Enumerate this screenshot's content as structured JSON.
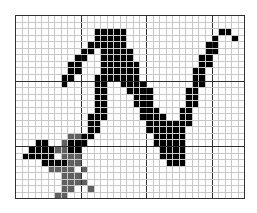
{
  "editor": {
    "type": "pixel-grid",
    "cols": 35,
    "rows": 28,
    "cell_px": 6.55,
    "major_every": 10,
    "colors": {
      "background": "#ffffff",
      "minor_grid": "#c8c8c8",
      "major_grid": "#303030",
      "ink": "#000000",
      "gray": "#606060"
    },
    "black_cells": [
      [
        12,
        3
      ],
      [
        13,
        2
      ],
      [
        14,
        2
      ],
      [
        15,
        2
      ],
      [
        16,
        2
      ],
      [
        12,
        2
      ],
      [
        11,
        4
      ],
      [
        12,
        4
      ],
      [
        10,
        5
      ],
      [
        11,
        5
      ],
      [
        9,
        6
      ],
      [
        10,
        6
      ],
      [
        8,
        7
      ],
      [
        9,
        7
      ],
      [
        8,
        8
      ],
      [
        9,
        8
      ],
      [
        7,
        9
      ],
      [
        8,
        9
      ],
      [
        7,
        10
      ],
      [
        13,
        3
      ],
      [
        14,
        3
      ],
      [
        15,
        3
      ],
      [
        16,
        3
      ],
      [
        13,
        4
      ],
      [
        14,
        4
      ],
      [
        15,
        4
      ],
      [
        16,
        4
      ],
      [
        13,
        5
      ],
      [
        14,
        5
      ],
      [
        15,
        5
      ],
      [
        16,
        5
      ],
      [
        17,
        5
      ],
      [
        13,
        6
      ],
      [
        14,
        6
      ],
      [
        15,
        6
      ],
      [
        16,
        6
      ],
      [
        17,
        6
      ],
      [
        13,
        7
      ],
      [
        14,
        7
      ],
      [
        15,
        7
      ],
      [
        16,
        7
      ],
      [
        17,
        7
      ],
      [
        18,
        7
      ],
      [
        13,
        8
      ],
      [
        14,
        8
      ],
      [
        15,
        8
      ],
      [
        16,
        8
      ],
      [
        17,
        8
      ],
      [
        18,
        8
      ],
      [
        12,
        9
      ],
      [
        13,
        9
      ],
      [
        14,
        9
      ],
      [
        15,
        9
      ],
      [
        16,
        9
      ],
      [
        17,
        9
      ],
      [
        18,
        9
      ],
      [
        12,
        10
      ],
      [
        13,
        10
      ],
      [
        16,
        10
      ],
      [
        17,
        10
      ],
      [
        18,
        10
      ],
      [
        19,
        10
      ],
      [
        12,
        11
      ],
      [
        13,
        11
      ],
      [
        17,
        11
      ],
      [
        18,
        11
      ],
      [
        19,
        11
      ],
      [
        20,
        11
      ],
      [
        12,
        12
      ],
      [
        13,
        12
      ],
      [
        18,
        12
      ],
      [
        19,
        12
      ],
      [
        20,
        12
      ],
      [
        12,
        13
      ],
      [
        13,
        13
      ],
      [
        18,
        13
      ],
      [
        19,
        13
      ],
      [
        20,
        13
      ],
      [
        12,
        14
      ],
      [
        13,
        14
      ],
      [
        19,
        14
      ],
      [
        20,
        14
      ],
      [
        21,
        14
      ],
      [
        11,
        15
      ],
      [
        12,
        15
      ],
      [
        13,
        15
      ],
      [
        19,
        15
      ],
      [
        20,
        15
      ],
      [
        21,
        15
      ],
      [
        22,
        15
      ],
      [
        11,
        16
      ],
      [
        12,
        16
      ],
      [
        20,
        16
      ],
      [
        21,
        16
      ],
      [
        22,
        16
      ],
      [
        23,
        16
      ],
      [
        11,
        17
      ],
      [
        12,
        17
      ],
      [
        20,
        17
      ],
      [
        21,
        17
      ],
      [
        22,
        17
      ],
      [
        23,
        17
      ],
      [
        10,
        18
      ],
      [
        11,
        18
      ],
      [
        21,
        18
      ],
      [
        22,
        18
      ],
      [
        23,
        18
      ],
      [
        24,
        18
      ],
      [
        21,
        19
      ],
      [
        22,
        19
      ],
      [
        23,
        19
      ],
      [
        24,
        19
      ],
      [
        9,
        19
      ],
      [
        10,
        19
      ],
      [
        22,
        20
      ],
      [
        23,
        20
      ],
      [
        24,
        20
      ],
      [
        25,
        20
      ],
      [
        22,
        21
      ],
      [
        23,
        21
      ],
      [
        24,
        21
      ],
      [
        25,
        21
      ],
      [
        23,
        22
      ],
      [
        24,
        22
      ],
      [
        25,
        22
      ],
      [
        24,
        17
      ],
      [
        25,
        17
      ],
      [
        25,
        16
      ],
      [
        26,
        16
      ],
      [
        25,
        15
      ],
      [
        26,
        15
      ],
      [
        25,
        14
      ],
      [
        26,
        14
      ],
      [
        26,
        13
      ],
      [
        27,
        13
      ],
      [
        26,
        12
      ],
      [
        27,
        12
      ],
      [
        26,
        11
      ],
      [
        27,
        11
      ],
      [
        27,
        10
      ],
      [
        28,
        10
      ],
      [
        27,
        9
      ],
      [
        28,
        9
      ],
      [
        27,
        8
      ],
      [
        28,
        8
      ],
      [
        28,
        7
      ],
      [
        29,
        7
      ],
      [
        28,
        6
      ],
      [
        29,
        6
      ],
      [
        29,
        5
      ],
      [
        30,
        5
      ],
      [
        29,
        4
      ],
      [
        30,
        4
      ],
      [
        30,
        3
      ],
      [
        31,
        2
      ],
      [
        32,
        2
      ],
      [
        33,
        3
      ],
      [
        24,
        16
      ],
      [
        25,
        18
      ],
      [
        25,
        19
      ],
      [
        3,
        19
      ],
      [
        4,
        19
      ],
      [
        2,
        20
      ],
      [
        3,
        20
      ],
      [
        4,
        20
      ],
      [
        5,
        20
      ],
      [
        1,
        21
      ],
      [
        2,
        21
      ],
      [
        3,
        21
      ],
      [
        4,
        21
      ],
      [
        5,
        21
      ],
      [
        4,
        22
      ],
      [
        5,
        22
      ],
      [
        6,
        22
      ],
      [
        7,
        22
      ],
      [
        8,
        20
      ],
      [
        9,
        20
      ],
      [
        8,
        19
      ]
    ],
    "gray_cells": [
      [
        8,
        18
      ],
      [
        9,
        18
      ],
      [
        7,
        19
      ],
      [
        7,
        20
      ],
      [
        6,
        20
      ],
      [
        7,
        21
      ],
      [
        8,
        21
      ],
      [
        9,
        21
      ],
      [
        5,
        23
      ],
      [
        6,
        23
      ],
      [
        7,
        23
      ],
      [
        8,
        23
      ],
      [
        8,
        22
      ],
      [
        9,
        22
      ],
      [
        7,
        24
      ],
      [
        8,
        24
      ],
      [
        10,
        23
      ],
      [
        7,
        25
      ],
      [
        8,
        25
      ],
      [
        9,
        25
      ],
      [
        10,
        25
      ],
      [
        11,
        26
      ],
      [
        7,
        26
      ],
      [
        8,
        26
      ],
      [
        7,
        27
      ],
      [
        6,
        27
      ],
      [
        9,
        24
      ]
    ]
  }
}
